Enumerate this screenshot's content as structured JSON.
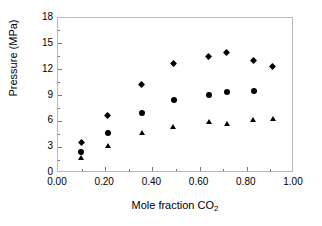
{
  "chart_data": {
    "type": "scatter",
    "title": "",
    "xlabel": "Mole fraction CO2",
    "xlabel_main": "Mole fraction CO",
    "xlabel_sub": "2",
    "ylabel": "Pressure (MPa)",
    "xlim": [
      0.0,
      1.0
    ],
    "ylim": [
      0,
      18
    ],
    "xticks": [
      "0.00",
      "0.20",
      "0.40",
      "0.60",
      "0.80",
      "1.00"
    ],
    "xtick_values": [
      0.0,
      0.2,
      0.4,
      0.6,
      0.8,
      1.0
    ],
    "yticks": [
      "0",
      "3",
      "6",
      "9",
      "12",
      "15",
      "18"
    ],
    "ytick_values": [
      0,
      3,
      6,
      9,
      12,
      15,
      18
    ],
    "grid": false,
    "legend": "none",
    "marker_color": "#000000",
    "frame_color": "#b9b9b9",
    "series": [
      {
        "name": "diamonds",
        "marker": "diamond",
        "points": [
          {
            "x": 0.102,
            "y": 3.4
          },
          {
            "x": 0.215,
            "y": 6.6
          },
          {
            "x": 0.36,
            "y": 10.2
          },
          {
            "x": 0.494,
            "y": 12.6
          },
          {
            "x": 0.643,
            "y": 13.4
          },
          {
            "x": 0.72,
            "y": 13.85
          },
          {
            "x": 0.833,
            "y": 12.9
          },
          {
            "x": 0.915,
            "y": 12.2
          }
        ]
      },
      {
        "name": "circles",
        "marker": "circle",
        "points": [
          {
            "x": 0.102,
            "y": 2.3
          },
          {
            "x": 0.215,
            "y": 4.5
          },
          {
            "x": 0.36,
            "y": 6.85
          },
          {
            "x": 0.494,
            "y": 8.4
          },
          {
            "x": 0.643,
            "y": 8.9
          },
          {
            "x": 0.72,
            "y": 9.25
          },
          {
            "x": 0.833,
            "y": 9.4
          }
        ]
      },
      {
        "name": "triangles",
        "marker": "triangle",
        "points": [
          {
            "x": 0.102,
            "y": 1.55
          },
          {
            "x": 0.215,
            "y": 2.95
          },
          {
            "x": 0.36,
            "y": 4.5
          },
          {
            "x": 0.494,
            "y": 5.15
          },
          {
            "x": 0.643,
            "y": 5.75
          },
          {
            "x": 0.72,
            "y": 5.5
          },
          {
            "x": 0.833,
            "y": 6.0
          },
          {
            "x": 0.915,
            "y": 6.1
          }
        ]
      }
    ]
  }
}
